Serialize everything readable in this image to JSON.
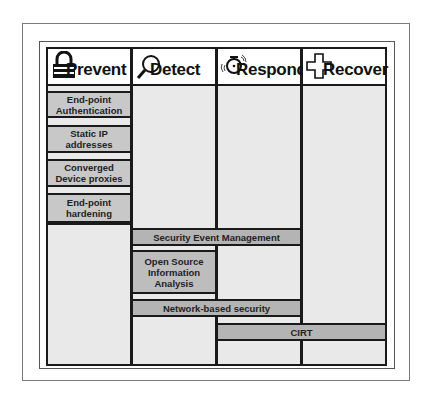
{
  "columns": [
    {
      "title": "Prevent",
      "icon": "padlock-icon"
    },
    {
      "title": "Detect",
      "icon": "magnifying-glass-icon"
    },
    {
      "title": "Respond",
      "icon": "alarm-clock-icon"
    },
    {
      "title": "Recover",
      "icon": "medical-cross-icon"
    }
  ],
  "prevent_items": [
    {
      "line1": "End-point",
      "line2": "Authentication"
    },
    {
      "line1": "Static IP",
      "line2": "addresses"
    },
    {
      "line1": "Converged",
      "line2": "Device proxies"
    },
    {
      "line1": "End-point",
      "line2": "hardening"
    }
  ],
  "spanning_items": {
    "sem": "Security Event Management",
    "osia": {
      "line1": "Open Source",
      "line2": "Information",
      "line3": "Analysis"
    },
    "network": "Network-based security",
    "cirt": "CIRT"
  },
  "colors": {
    "column_fill": "#e9e9e9",
    "box_fill": "#c8c8c8",
    "bar_fill": "#b4b4b4",
    "line": "#1a1a1a"
  }
}
